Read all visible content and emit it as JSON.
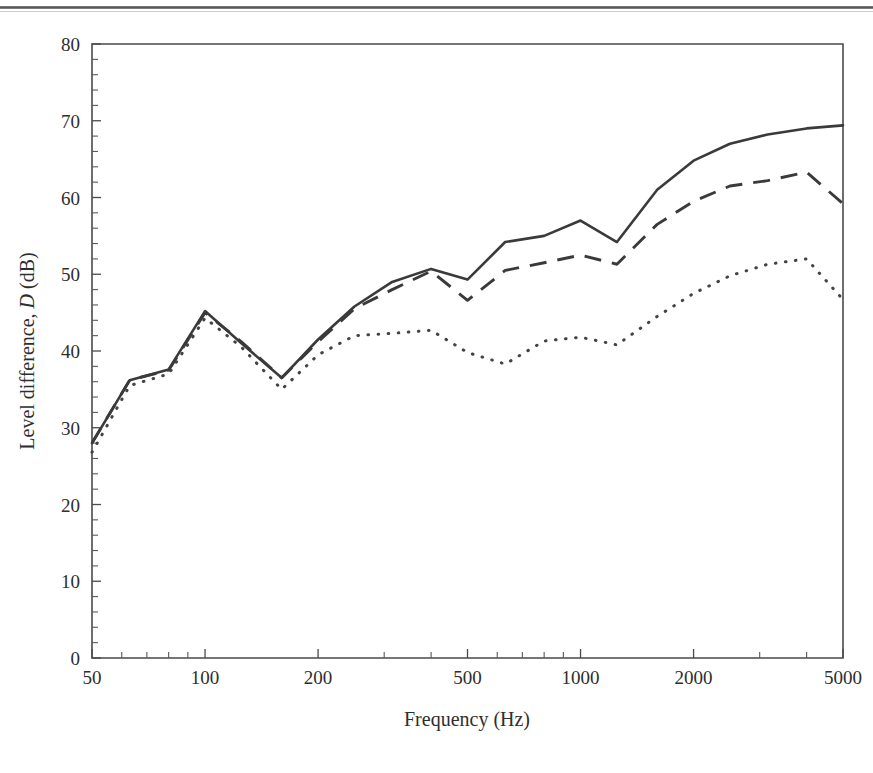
{
  "figure": {
    "title": "",
    "page_rule": "horizontal-rule"
  },
  "axes": {
    "x_label": "Frequency (Hz)",
    "y_label_pre": "Level difference, ",
    "y_label_italic": "D",
    "y_label_post": " (dB)",
    "x_tick_labels": [
      "50",
      "100",
      "200",
      "500",
      "1000",
      "2000",
      "5000"
    ],
    "y_tick_labels": [
      "0",
      "10",
      "20",
      "30",
      "40",
      "50",
      "60",
      "70",
      "80"
    ]
  },
  "chart_data": {
    "type": "line",
    "title": "",
    "xlabel": "Frequency (Hz)",
    "ylabel": "Level difference, D (dB)",
    "xscale": "log",
    "yscale": "linear",
    "xlim": [
      50,
      5000
    ],
    "ylim": [
      0,
      80
    ],
    "yticks": [
      0,
      10,
      20,
      30,
      40,
      50,
      60,
      70,
      80
    ],
    "xticks": [
      50,
      100,
      200,
      500,
      1000,
      2000,
      5000
    ],
    "grid": false,
    "legend": "none",
    "series": [
      {
        "name": "solid",
        "linestyle": "solid",
        "color": "#3a3a3a",
        "x": [
          50,
          63,
          80,
          100,
          125,
          160,
          200,
          250,
          315,
          400,
          500,
          630,
          800,
          1000,
          1250,
          1600,
          2000,
          2500,
          3150,
          4000,
          5000
        ],
        "values": [
          28.0,
          36.2,
          37.6,
          45.2,
          41.0,
          36.5,
          41.5,
          45.8,
          49.0,
          50.7,
          49.3,
          54.2,
          55.0,
          57.0,
          54.2,
          61.0,
          64.8,
          67.0,
          68.2,
          69.0,
          69.4
        ]
      },
      {
        "name": "dashed",
        "linestyle": "dashed",
        "color": "#3a3a3a",
        "x": [
          50,
          63,
          80,
          100,
          125,
          160,
          200,
          250,
          315,
          400,
          500,
          630,
          800,
          1000,
          1250,
          1600,
          2000,
          2500,
          3150,
          4000,
          5000
        ],
        "values": [
          28.0,
          36.2,
          37.5,
          45.0,
          41.2,
          36.5,
          41.2,
          45.5,
          48.0,
          50.4,
          46.6,
          50.5,
          51.5,
          52.5,
          51.3,
          56.5,
          59.5,
          61.5,
          62.2,
          63.3,
          59.2
        ]
      },
      {
        "name": "dotted",
        "linestyle": "dotted",
        "color": "#434343",
        "x": [
          50,
          63,
          80,
          100,
          125,
          160,
          200,
          250,
          315,
          400,
          500,
          630,
          800,
          1000,
          1250,
          1600,
          2000,
          2500,
          3150,
          4000,
          5000
        ],
        "values": [
          26.8,
          35.5,
          37.0,
          44.3,
          40.5,
          35.0,
          39.5,
          42.0,
          42.3,
          42.7,
          39.8,
          38.3,
          41.3,
          41.8,
          40.8,
          44.5,
          47.5,
          49.8,
          51.3,
          52.0,
          46.7
        ]
      }
    ]
  }
}
